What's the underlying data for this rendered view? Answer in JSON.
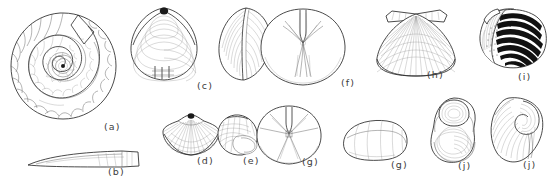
{
  "plate": {
    "title": "Fossil and shell specimen plate",
    "description": "Pen-and-ink scientific illustrations of invertebrate fossil specimens arranged in two rows, each captioned with a parenthesized letter.",
    "background_color": "#ffffff",
    "ink_color": "#2b2b2b",
    "label_color": "#3c3c3c",
    "width": 552,
    "height": 186
  },
  "figures": [
    {
      "key": "a",
      "label": "(a)",
      "name": "ammonite-coiled-shell",
      "description": "Planispiral coiled ammonite shell with radial ribs and logarithmic whorls",
      "row": "top",
      "label_x": 104,
      "label_y": 121
    },
    {
      "key": "b",
      "label": "(b)",
      "name": "elongate-tapering-shell",
      "description": "Long slender tapering conical shell shown in lateral view",
      "row": "bottom",
      "label_x": 108,
      "label_y": 166
    },
    {
      "key": "c",
      "label": "(c)",
      "name": "bivalve-clam-valve",
      "description": "Bivalve clam valve in exterior view with concentric growth lines, paired with oblique view",
      "row": "top",
      "label_x": 196,
      "label_y": 80
    },
    {
      "key": "d",
      "label": "(d)",
      "name": "brachiopod-ribbed-shell",
      "description": "Small ribbed brachiopod shell with pointed beak and radiating costae",
      "row": "bottom",
      "label_x": 197,
      "label_y": 156
    },
    {
      "key": "e",
      "label": "(e)",
      "name": "gastropod-snail-shell",
      "description": "Small globular gastropod snail shell showing aperture",
      "row": "bottom",
      "label_x": 243,
      "label_y": 156
    },
    {
      "key": "f",
      "label": "(f)",
      "name": "echinoid-sand-dollar-aboral",
      "description": "Flat rounded echinoid test with five-rayed petaloid ambulacra, aboral view",
      "row": "top",
      "label_x": 341,
      "label_y": 77
    },
    {
      "key": "g",
      "label": "(g)",
      "name": "echinoid-sand-dollar-oral",
      "description": "Rounded echinoid test with five radiating grooves, oral view",
      "row": "bottom",
      "label_x": 302,
      "label_y": 163
    },
    {
      "key": "g2",
      "label": "(g)",
      "name": "echinoid-sand-dollar-lateral",
      "description": "Same echinoid shown in low-domed lateral profile view",
      "row": "bottom",
      "label_x": 391,
      "label_y": 163
    },
    {
      "key": "h",
      "label": "(h)",
      "name": "scallop-pecten-shell",
      "description": "Fan-shaped pectinid scallop valve with radiating ribs and hinge auricles",
      "row": "top",
      "label_x": 427,
      "label_y": 72
    },
    {
      "key": "i",
      "label": "(i)",
      "name": "ribbed-bivalve-dark-shell",
      "description": "Bivalve shell in oblique view with bold dark concentric ribs and punctate area",
      "row": "top",
      "label_x": 518,
      "label_y": 72
    },
    {
      "key": "j",
      "label": "(j)",
      "name": "oyster-concentric-shell",
      "description": "Oyster-like bivalve with strong concentric growth lamellae, frontal view",
      "row": "bottom",
      "label_x": 460,
      "label_y": 163
    },
    {
      "key": "j2",
      "label": "(j)",
      "name": "oyster-coiled-umbo-shell",
      "description": "Oyster-like bivalve with incurved coiled umbo, lateral view",
      "row": "bottom",
      "label_x": 523,
      "label_y": 163
    }
  ]
}
